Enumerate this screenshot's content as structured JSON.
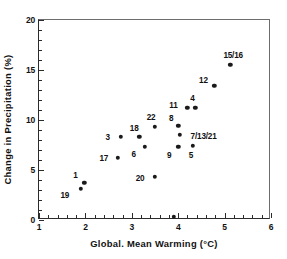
{
  "chart_data": {
    "type": "scatter",
    "title": "",
    "xlabel": "Global. Mean Warming (°C)",
    "ylabel": "Change in Precipitation (%)",
    "xlim": [
      1,
      6
    ],
    "ylim": [
      0,
      20
    ],
    "xticks": [
      1,
      2,
      3,
      4,
      5,
      6
    ],
    "xtick_labels": [
      "1",
      "2",
      "3",
      "4",
      "5",
      "6"
    ],
    "yticks": [
      0,
      5,
      10,
      15,
      20
    ],
    "ytick_labels": [
      "0",
      "5",
      "10",
      "15",
      "20"
    ],
    "x_minor_interval": 0.2,
    "y_minor_interval": 1,
    "grid": false,
    "legend": false,
    "marker": "filled-circle",
    "marker_color": "#1a1a1a",
    "points": [
      {
        "label": "19",
        "x": 1.9,
        "y": 3.1,
        "label_dx": -16,
        "label_dy": 6
      },
      {
        "label": "1",
        "x": 1.98,
        "y": 3.7,
        "label_dx": -9,
        "label_dy": -8
      },
      {
        "label": "17",
        "x": 2.7,
        "y": 6.2,
        "label_dx": -14,
        "label_dy": 0
      },
      {
        "label": "3",
        "x": 2.76,
        "y": 8.3,
        "label_dx": -13,
        "label_dy": 0
      },
      {
        "label": "18",
        "x": 3.16,
        "y": 8.3,
        "label_dx": -5,
        "label_dy": -9
      },
      {
        "label": "6",
        "x": 3.28,
        "y": 7.3,
        "label_dx": -11,
        "label_dy": 7
      },
      {
        "label": "22",
        "x": 3.5,
        "y": 9.3,
        "label_dx": -4,
        "label_dy": -10
      },
      {
        "label": "20",
        "x": 3.5,
        "y": 4.35,
        "label_dx": -15,
        "label_dy": 1
      },
      {
        "label": "",
        "x": 3.9,
        "y": 0.3,
        "label_dx": 0,
        "label_dy": 0
      },
      {
        "label": "8",
        "x": 4.0,
        "y": 9.4,
        "label_dx": -7,
        "label_dy": -8
      },
      {
        "label": "7/13/21",
        "x": 4.03,
        "y": 8.5,
        "label_dx": 24,
        "label_dy": 1
      },
      {
        "label": "9",
        "x": 4.0,
        "y": 7.35,
        "label_dx": -9,
        "label_dy": 8
      },
      {
        "label": "11",
        "x": 4.2,
        "y": 11.25,
        "label_dx": -14,
        "label_dy": -3
      },
      {
        "label": "5",
        "x": 4.32,
        "y": 7.4,
        "label_dx": -2,
        "label_dy": 9
      },
      {
        "label": "4",
        "x": 4.37,
        "y": 11.25,
        "label_dx": -3,
        "label_dy": -10
      },
      {
        "label": "12",
        "x": 4.78,
        "y": 13.4,
        "label_dx": -11,
        "label_dy": -6
      },
      {
        "label": "15/16",
        "x": 5.12,
        "y": 15.5,
        "label_dx": 3,
        "label_dy": -10
      }
    ]
  }
}
